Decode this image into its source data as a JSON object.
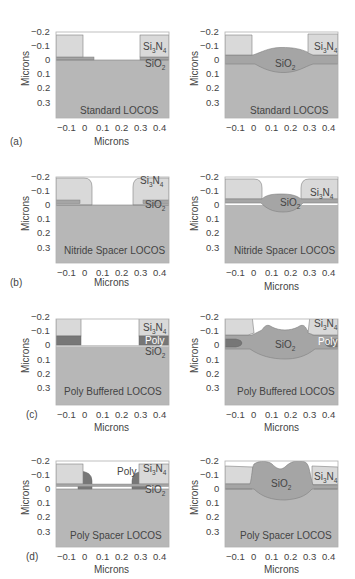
{
  "figure": {
    "axis_label_x": "Microns",
    "axis_label_y": "Microns",
    "x_ticks": [
      "−0.1",
      "0",
      "0.1",
      "0.2",
      "0.3",
      "0.4"
    ],
    "y_ticks": [
      "−0.2",
      "−0.1",
      "0",
      "0.1",
      "0.2",
      "0.3"
    ],
    "colors": {
      "substrate": "#b7b7b7",
      "oxide": "#a5a5a5",
      "nitride": "#d9d9d9",
      "poly": "#777777",
      "outline": "#7f7f7f",
      "background": "#ffffff"
    },
    "rows": [
      {
        "tag": "(a)",
        "title": "Standard LOCOS",
        "materials": {
          "nitride": "Si3N4",
          "oxide": "SiO2"
        },
        "left": {
          "labels": [
            "Si3N4",
            "SiO2"
          ]
        },
        "right": {
          "labels": [
            "Si3N4",
            "SiO2"
          ]
        }
      },
      {
        "tag": "(b)",
        "title": "Nitride Spacer  LOCOS",
        "materials": {
          "nitride": "Si3N4",
          "oxide": "SiO2"
        },
        "left": {
          "labels": [
            "Si3N4",
            "SiO2"
          ]
        },
        "right": {
          "labels": [
            "Si3N4",
            "SiO2"
          ]
        }
      },
      {
        "tag": "(c)",
        "title": "Poly Buffered LOCOS",
        "materials": {
          "nitride": "Si3N4",
          "poly": "Poly",
          "oxide": "SiO2"
        },
        "left": {
          "labels": [
            "Si3N4",
            "Poly",
            "SiO2"
          ]
        },
        "right": {
          "labels": [
            "Si3N4",
            "Poly",
            "SiO2"
          ]
        }
      },
      {
        "tag": "(d)",
        "title": "Poly Spacer LOCOS",
        "materials": {
          "nitride": "Si3N4",
          "poly": "Poly",
          "oxide": "SiO2"
        },
        "left": {
          "labels": [
            "Poly",
            "Si3N4",
            "SiO2"
          ]
        },
        "right": {
          "labels": [
            "Si3N4",
            "SiO2"
          ]
        }
      }
    ]
  },
  "text": {
    "si": "Si",
    "n": "N",
    "o": "O",
    "sub3": "3",
    "sub4": "4",
    "sub2": "2",
    "poly": "Poly",
    "a": "(a)",
    "b": "(b)",
    "c": "(c)",
    "d": "(d)",
    "title_a": "Standard LOCOS",
    "title_b": "Nitride Spacer  LOCOS",
    "title_c": "Poly Buffered LOCOS",
    "title_d": "Poly Spacer LOCOS",
    "microns": "Microns",
    "xt": [
      "−0.1",
      "0",
      "0.1",
      "0.2",
      "0.3",
      "0.4"
    ],
    "yt": [
      "−0.2",
      "−0.1",
      "0",
      "0.1",
      "0.2",
      "0.3"
    ]
  }
}
